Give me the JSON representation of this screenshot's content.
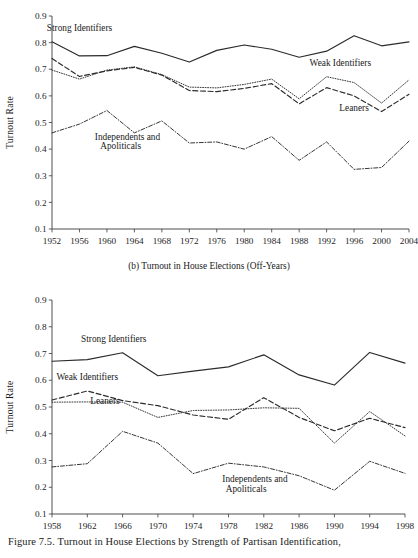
{
  "figure": {
    "caption": "Figure 7.5. Turnout in House Elections by Strength of Partisan Identification,",
    "panel_a_subtitle": "",
    "panel_b_subtitle": "(b) Turnout in House Elections (Off-Years)"
  },
  "chart_data": [
    {
      "id": "panel-a",
      "type": "line",
      "title": "",
      "xlabel": "",
      "ylabel": "Turnout Rate",
      "ylim": [
        0.1,
        0.9
      ],
      "yticks": [
        0.1,
        0.2,
        0.3,
        0.4,
        0.5,
        0.6,
        0.7,
        0.8,
        0.9
      ],
      "ytick_labels": [
        "0.1",
        "0.2",
        "0.3",
        "0.4",
        "0.5",
        "0.6",
        "0.7",
        "0.8",
        "0.9"
      ],
      "grid": false,
      "legend_position": "inline-annotations",
      "categories": [
        1952,
        1956,
        1960,
        1964,
        1968,
        1972,
        1976,
        1980,
        1984,
        1988,
        1992,
        1996,
        2000,
        2004
      ],
      "xtick_labels": [
        "1952",
        "1956",
        "1960",
        "1964",
        "1968",
        "1972",
        "1976",
        "1980",
        "1984",
        "1988",
        "1992",
        "1996",
        "2000",
        "2004"
      ],
      "series": [
        {
          "name": "Strong Identifiers",
          "style": "solid",
          "values": [
            0.803,
            0.75,
            0.751,
            0.786,
            0.76,
            0.727,
            0.771,
            0.791,
            0.775,
            0.745,
            0.768,
            0.826,
            0.788,
            0.803
          ]
        },
        {
          "name": "Weak Identifiers",
          "style": "dotted",
          "values": [
            0.697,
            0.663,
            0.697,
            0.709,
            0.68,
            0.633,
            0.63,
            0.643,
            0.663,
            0.589,
            0.672,
            0.65,
            0.573,
            0.66
          ]
        },
        {
          "name": "Leaners",
          "style": "dashed",
          "values": [
            0.74,
            0.673,
            0.694,
            0.707,
            0.678,
            0.62,
            0.616,
            0.628,
            0.646,
            0.57,
            0.631,
            0.6,
            0.541,
            0.606
          ]
        },
        {
          "name": "Independents and Apoliticals",
          "style": "dash-dot",
          "values": [
            0.461,
            0.494,
            0.545,
            0.461,
            0.506,
            0.423,
            0.427,
            0.4,
            0.447,
            0.358,
            0.427,
            0.324,
            0.331,
            0.43
          ]
        }
      ],
      "annotations": [
        {
          "text": "Strong Identifiers",
          "x": 1956,
          "y": 0.845
        },
        {
          "text": "Weak Identifiers",
          "x": 1994,
          "y": 0.712
        },
        {
          "text": "Leaners",
          "x": 1996,
          "y": 0.545
        },
        {
          "text": "Independents and",
          "x": 1963,
          "y": 0.435
        },
        {
          "text": "Apoliticals",
          "x": 1962,
          "y": 0.4
        }
      ]
    },
    {
      "id": "panel-b",
      "type": "line",
      "title": "(b) Turnout in House Elections (Off-Years)",
      "xlabel": "",
      "ylabel": "Turnout Rate",
      "ylim": [
        0.1,
        0.9
      ],
      "yticks": [
        0.1,
        0.2,
        0.3,
        0.4,
        0.5,
        0.6,
        0.7,
        0.8,
        0.9
      ],
      "ytick_labels": [
        "0.1",
        "0.2",
        "0.3",
        "0.4",
        "0.5",
        "0.6",
        "0.7",
        "0.8",
        "0.9"
      ],
      "grid": false,
      "legend_position": "inline-annotations",
      "categories": [
        1958,
        1962,
        1966,
        1970,
        1974,
        1978,
        1982,
        1986,
        1990,
        1994,
        1998
      ],
      "xtick_labels": [
        "1958",
        "1962",
        "1966",
        "1970",
        "1974",
        "1978",
        "1982",
        "1986",
        "1990",
        "1994",
        "1998"
      ],
      "series": [
        {
          "name": "Strong Identifiers",
          "style": "solid",
          "values": [
            0.671,
            0.677,
            0.703,
            0.617,
            0.634,
            0.65,
            0.695,
            0.62,
            0.582,
            0.704,
            0.664
          ]
        },
        {
          "name": "Weak Identifiers",
          "style": "dotted",
          "values": [
            0.518,
            0.519,
            0.518,
            0.461,
            0.487,
            0.489,
            0.497,
            0.495,
            0.365,
            0.483,
            0.392
          ]
        },
        {
          "name": "Leaners",
          "style": "dashed",
          "values": [
            0.526,
            0.56,
            0.524,
            0.505,
            0.47,
            0.454,
            0.535,
            0.461,
            0.411,
            0.458,
            0.423
          ]
        },
        {
          "name": "Independents and Apoliticals",
          "style": "dash-dot",
          "values": [
            0.276,
            0.288,
            0.409,
            0.365,
            0.251,
            0.29,
            0.276,
            0.243,
            0.189,
            0.297,
            0.252
          ]
        }
      ],
      "annotations": [
        {
          "text": "Strong Identifiers",
          "x": 1965,
          "y": 0.742
        },
        {
          "text": "Weak Identifiers",
          "x": 1962,
          "y": 0.6
        },
        {
          "text": "Leaners",
          "x": 1964,
          "y": 0.512
        },
        {
          "text": "Independents and",
          "x": 1981,
          "y": 0.218
        },
        {
          "text": "Apoliticals",
          "x": 1980,
          "y": 0.182
        }
      ]
    }
  ]
}
